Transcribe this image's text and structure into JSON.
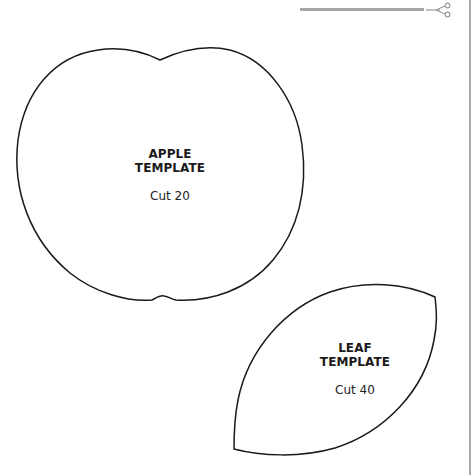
{
  "cut_guide": {
    "icon": "scissors-icon",
    "line_color": "#a6a6a6"
  },
  "templates": [
    {
      "name": "apple",
      "title_line1": "APPLE",
      "title_line2": "TEMPLATE",
      "instruction": "Cut 20"
    },
    {
      "name": "leaf",
      "title_line1": "LEAF",
      "title_line2": "TEMPLATE",
      "instruction": "Cut 40"
    }
  ],
  "colors": {
    "outline": "#1a1a1a",
    "background": "#ffffff",
    "rule": "#a9a9a9"
  }
}
